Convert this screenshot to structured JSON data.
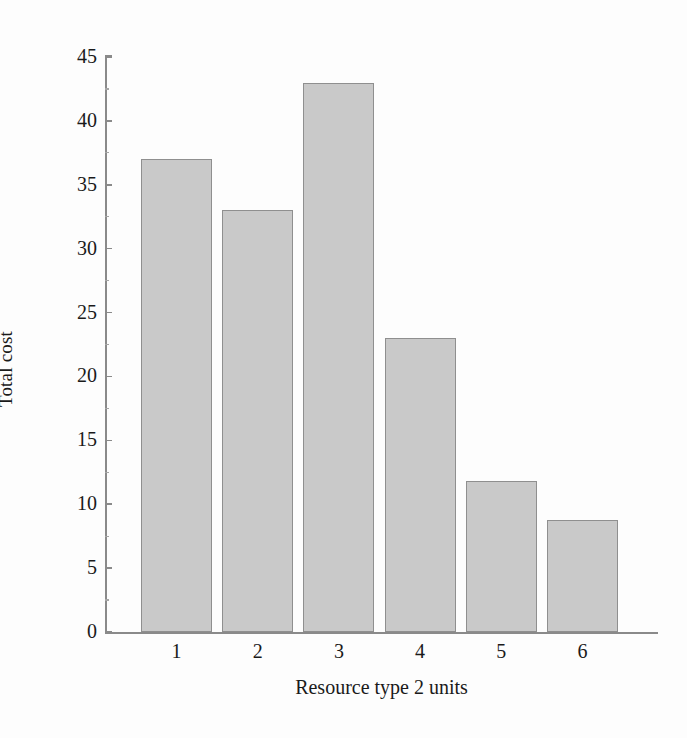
{
  "chart_data": {
    "type": "bar",
    "title": "",
    "xlabel": "Resource type 2 units",
    "ylabel": "Total cost",
    "categories": [
      "1",
      "2",
      "3",
      "4",
      "5",
      "6"
    ],
    "values": [
      37,
      33,
      43,
      23,
      11.8,
      8.8
    ],
    "ylim": [
      0,
      45
    ],
    "yticks": [
      0,
      5,
      10,
      15,
      20,
      25,
      30,
      35,
      40,
      45
    ],
    "ytick_labels": [
      "0",
      "5",
      "10",
      "15",
      "20",
      "25",
      "30",
      "35",
      "40",
      "45"
    ],
    "grid": false,
    "legend": null,
    "series": [
      {
        "name": "Total cost",
        "values": [
          37,
          33,
          43,
          23,
          11.8,
          8.8
        ]
      }
    ],
    "colors": {
      "bar_fill": "#c9c9c9",
      "bar_edge": "#8f8f8f",
      "axis": "#8a8a8a",
      "text": "#1a1a1a",
      "background": "#fdfdfd"
    }
  }
}
